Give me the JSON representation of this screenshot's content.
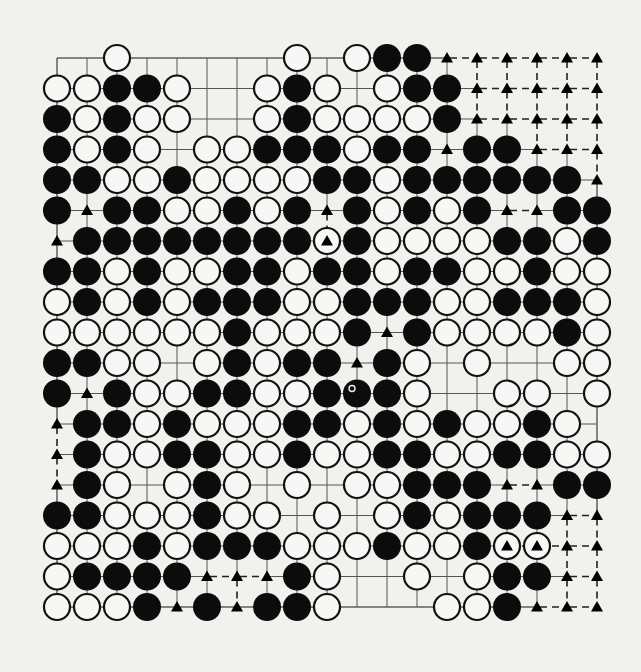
{
  "diagram": {
    "type": "go-board",
    "size": 19,
    "legend": {
      ".": "empty",
      "B": "black-stone",
      "W": "white-stone",
      "t": "triangle-on-empty-point",
      "T": "white-stone-with-triangle",
      "M": "black-stone-with-mark"
    },
    "rows": [
      "..W.....W.WBBtttttt",
      "WWBBW..WBW.WBBttttt",
      "BWBWW..WBWWWWBttttt",
      "BWBW.WWBBBWBBtBBttt",
      "BBWWBWWWWBBWBBBBBBt",
      "BtBBWWBWBtBWBWBttBB",
      "tBBBBBBBBTBWWWWBBWB",
      "BBWBWWBBWBBWBBWWBWW",
      "WBWBWBBBWWBBBWWBBBW",
      "WWWWWWBWWWBtBWWWWBW",
      "BBWW.WBWBBtBW.W..WW",
      "BtBWWBBWWBMBW..WW.W",
      "tBBWBWWWBBWBWBWWBW.",
      "tBWWBBWWBWWBBWWBBWW",
      "tBW.WBW.W.WWBBBttBB",
      "BBWWWBWW.W.WBWBBBtt",
      "WWWBWBBBWWWBWWBTTtt",
      "WBBBBtttBW..W.WBBtt",
      "WWWBtBtBBW...WWBttt"
    ],
    "colors": {
      "background": "#f1f1ee",
      "grid_line": "#555555",
      "black_stone": "#0c0c0c",
      "white_stone_fill": "#f7f7f5",
      "stone_outline": "#111111",
      "triangle": "#000000"
    }
  }
}
